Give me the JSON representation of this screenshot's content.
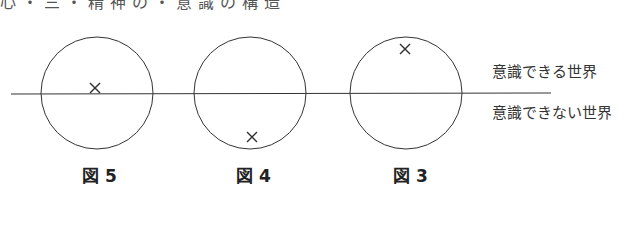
{
  "heading": "心・三・精神の・意識の構造",
  "labels": {
    "conscious": "意識できる世界",
    "unconscious": "意識できない世界"
  },
  "figures": [
    {
      "label": "図 5",
      "marker": "on-line"
    },
    {
      "label": "図 4",
      "marker": "below"
    },
    {
      "label": "図 3",
      "marker": "above"
    }
  ]
}
